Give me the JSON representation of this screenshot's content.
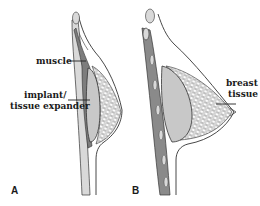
{
  "figure": {
    "panels": [
      {
        "id": "A",
        "letter": "A",
        "labels": {
          "muscle": "muscle",
          "implant_line1": "implant/",
          "implant_line2": "tissue expander"
        }
      },
      {
        "id": "B",
        "letter": "B",
        "labels": {
          "breast_line1": "breast",
          "breast_line2": "tissue"
        }
      }
    ],
    "colors": {
      "implant_fill": "#c8c8c8",
      "muscle_fill": "#8a8a8a",
      "outline": "#333333",
      "tissue_mesh": "#555555",
      "rib_fill": "#d9d9d9"
    }
  }
}
